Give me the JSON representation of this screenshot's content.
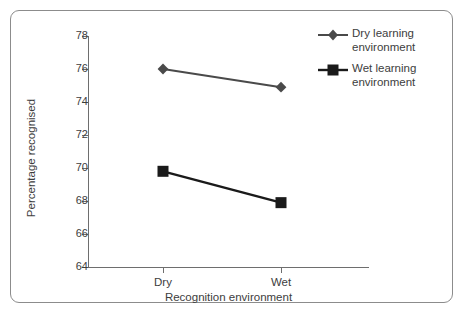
{
  "chart_data": {
    "type": "line",
    "title": "",
    "xlabel": "Recognition environment",
    "ylabel": "Percentage recognised",
    "categories": [
      "Dry",
      "Wet"
    ],
    "series": [
      {
        "name": "Dry learning environment",
        "marker": "diamond",
        "color": "#4a4a4a",
        "values": [
          76.0,
          74.9
        ]
      },
      {
        "name": "Wet learning environment",
        "marker": "square",
        "color": "#1a1a1a",
        "values": [
          69.8,
          67.9
        ]
      }
    ],
    "ylim": [
      64,
      78
    ],
    "yticks": [
      64,
      66,
      68,
      70,
      72,
      74,
      76,
      78
    ],
    "ytick_labels": [
      "64",
      "66",
      "68",
      "70",
      "72",
      "74",
      "76",
      "78"
    ],
    "grid": false,
    "legend_position": "top-right"
  },
  "legend": {
    "entries": [
      {
        "label_line1": "Dry learning",
        "label_line2": "environment",
        "marker": "diamond-marker"
      },
      {
        "label_line1": "Wet learning",
        "label_line2": "environment",
        "marker": "square-marker"
      }
    ]
  },
  "axes": {
    "y_title": "Percentage recognised",
    "x_title": "Recognition environment",
    "y_labels": [
      "78",
      "76",
      "74",
      "72",
      "70",
      "68",
      "66",
      "64"
    ],
    "x_labels": [
      "Dry",
      "Wet"
    ]
  },
  "colors": {
    "frame": "#8c8c8c",
    "axis": "#6e6e6e",
    "text": "#3d3d3d",
    "series_dry": "#4a4a4a",
    "series_wet": "#1a1a1a",
    "background": "#ffffff"
  }
}
